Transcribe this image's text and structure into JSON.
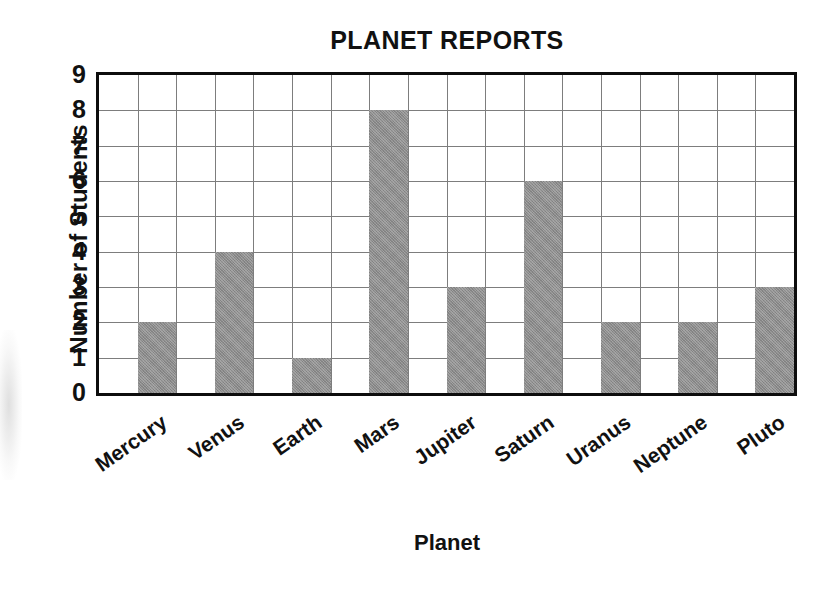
{
  "chart_data": {
    "type": "bar",
    "title": "PLANET REPORTS",
    "xlabel": "Planet",
    "ylabel": "Number of Students",
    "categories": [
      "Mercury",
      "Venus",
      "Earth",
      "Mars",
      "Jupiter",
      "Saturn",
      "Uranus",
      "Neptune",
      "Pluto"
    ],
    "values": [
      2,
      4,
      1,
      8,
      3,
      6,
      2,
      2,
      3
    ],
    "ylim": [
      0,
      9
    ],
    "ytick_labels": [
      "0",
      "1",
      "2",
      "3",
      "4",
      "5",
      "6",
      "7",
      "8",
      "9"
    ],
    "ytick_values": [
      0,
      1,
      2,
      3,
      4,
      5,
      6,
      7,
      8,
      9
    ],
    "grid": true,
    "legend": false,
    "bar_color": "#8c8c8c",
    "axis_color": "#0d0d0d",
    "grid_color": "#7d7d7d",
    "text_color": "#111111",
    "background": "#ffffff",
    "x_label_rotation_deg": -35,
    "columns_in_grid": 18
  }
}
